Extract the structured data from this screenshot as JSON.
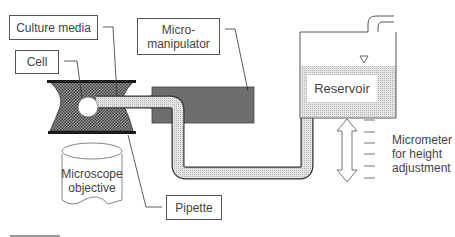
{
  "diagram": {
    "labels": {
      "culture_media": "Culture media",
      "cell": "Cell",
      "micromanipulator_line1": "Micro-",
      "micromanipulator_line2": "manipulator",
      "reservoir": "Reservoir",
      "microscope_line1": "Microscope",
      "microscope_line2": "objective",
      "pipette": "Pipette",
      "micrometer_line1": "Micrometer",
      "micrometer_line2": "for height",
      "micrometer_line3": "adjustment"
    },
    "colors": {
      "micromanipulator": "#6e6e6e",
      "fluid": "#d6d6d6",
      "chamber": "#555555",
      "outline": "#444444"
    }
  }
}
